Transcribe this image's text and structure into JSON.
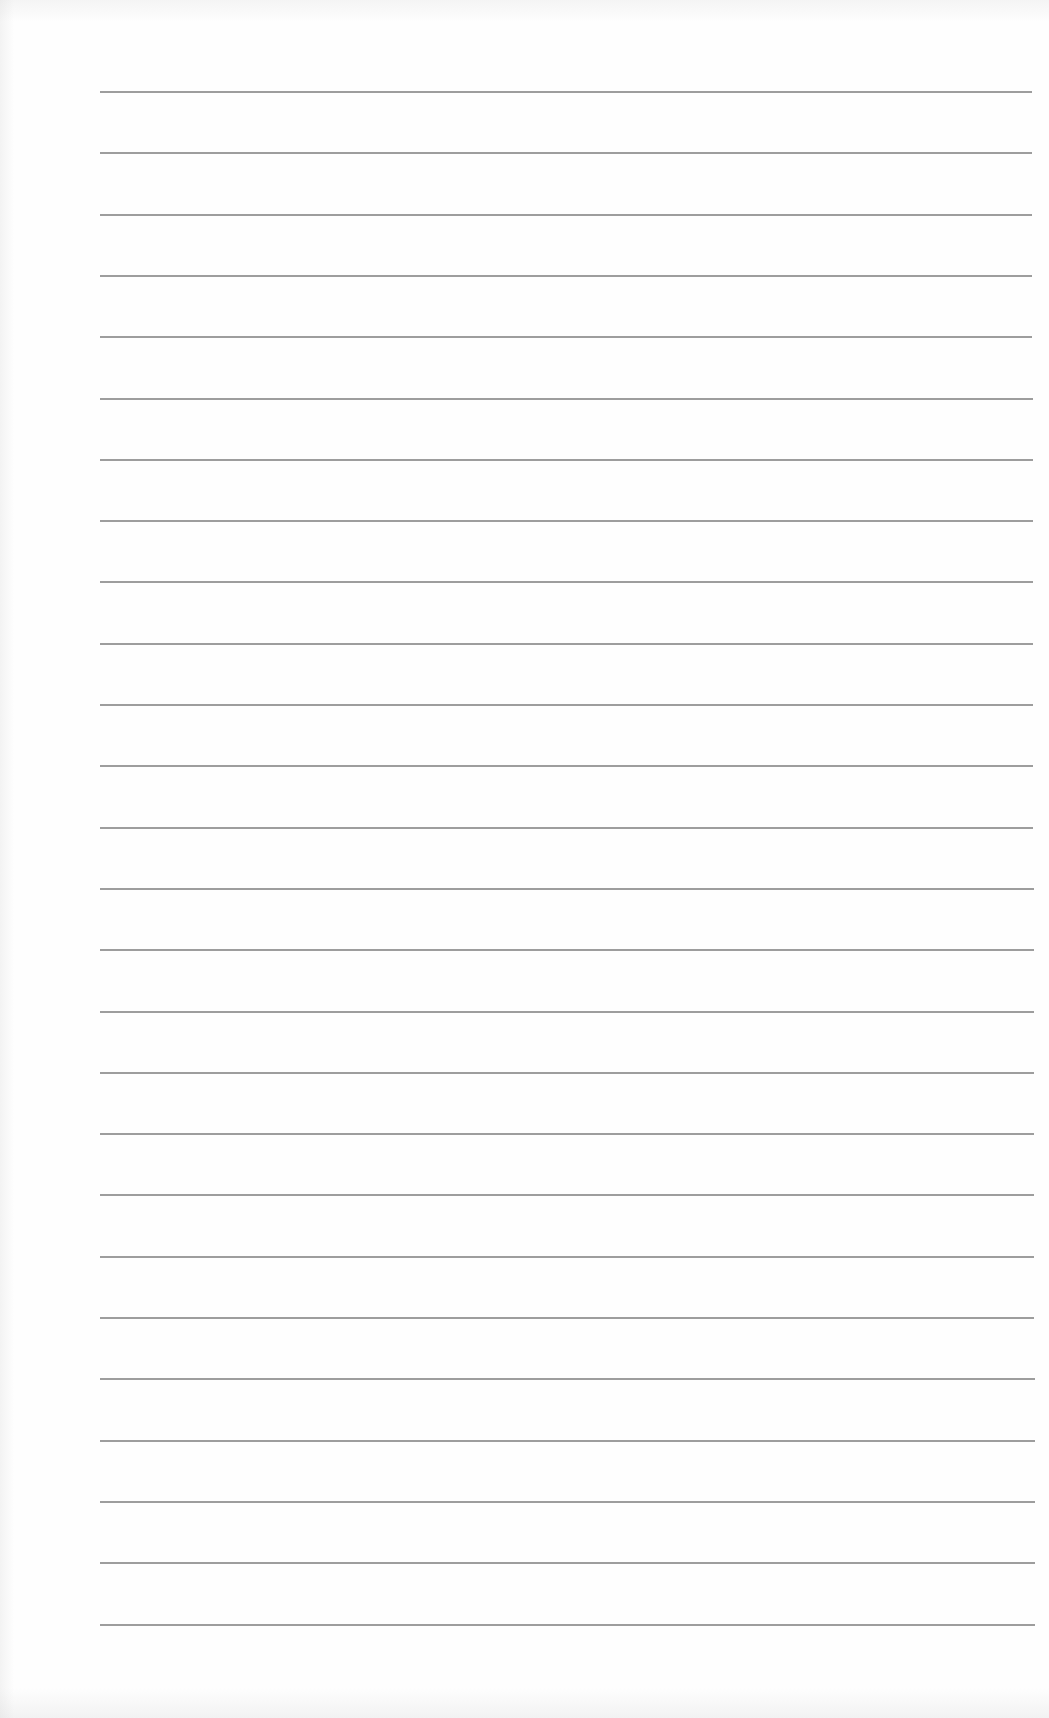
{
  "document": {
    "type": "lined-paper",
    "content": "",
    "line_count": 26,
    "colors": {
      "paper": "#fefefe",
      "rule": "#8c8c8c"
    },
    "rules": {
      "first_y": 91,
      "spacing": 61.3,
      "left_x": 100,
      "right_x_top": 1032,
      "right_x_bottom": 1035
    }
  }
}
